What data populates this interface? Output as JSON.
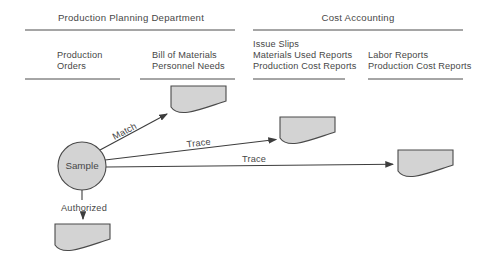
{
  "diagram": {
    "departments": [
      {
        "label": "Production Planning Department"
      },
      {
        "label": "Cost Accounting"
      }
    ],
    "document_groups": [
      {
        "lines": [
          "Production",
          "Orders"
        ]
      },
      {
        "lines": [
          "Bill of Materials",
          "Personnel Needs"
        ]
      },
      {
        "lines": [
          "Issue Slips",
          "Materials Used Reports",
          "Production Cost Reports"
        ]
      },
      {
        "lines": [
          "Labor Reports",
          "Production Cost Reports"
        ]
      }
    ],
    "sample_node": {
      "label": "Sample"
    },
    "procedures": [
      {
        "label": "Match"
      },
      {
        "label": "Trace"
      },
      {
        "label": "Trace"
      },
      {
        "label": "Authorized"
      }
    ],
    "colors": {
      "shape_fill": "#d3d3d3",
      "shape_stroke": "#4a4a4a",
      "line": "#3d3d3d",
      "background": "#ffffff"
    }
  }
}
